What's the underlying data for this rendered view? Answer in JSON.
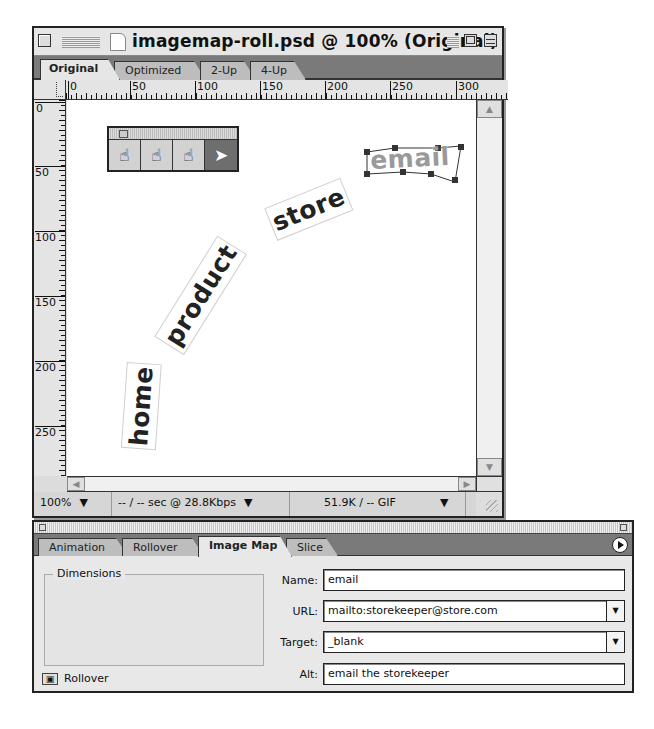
{
  "document_window": {
    "title": "imagemap-roll.psd @ 100% (Original)",
    "tabs": [
      {
        "label": "Original",
        "active": true
      },
      {
        "label": "Optimized",
        "active": false
      },
      {
        "label": "2-Up",
        "active": false
      },
      {
        "label": "4-Up",
        "active": false
      }
    ],
    "ruler_h": [
      "0",
      "50",
      "100",
      "150",
      "200",
      "250",
      "300"
    ],
    "ruler_v": [
      "0",
      "50",
      "100",
      "150",
      "200",
      "250"
    ],
    "tool_palette": {
      "tools": [
        {
          "name": "rectangle-image-map-tool",
          "glyph": "☝"
        },
        {
          "name": "circle-image-map-tool",
          "glyph": "☝"
        },
        {
          "name": "polygon-image-map-tool",
          "glyph": "☝"
        },
        {
          "name": "image-map-select-tool",
          "glyph": "➤"
        }
      ]
    },
    "canvas_words": [
      "home",
      "product",
      "store",
      "email"
    ],
    "status": {
      "zoom": "100%",
      "download": "-- / -- sec @ 28.8Kbps",
      "size_format": "51.9K / -- GIF"
    }
  },
  "panel": {
    "tabs": [
      {
        "label": "Animation",
        "active": false
      },
      {
        "label": "Rollover",
        "active": false
      },
      {
        "label": "Image Map",
        "active": true
      },
      {
        "label": "Slice",
        "active": false
      }
    ],
    "dimensions_label": "Dimensions",
    "rollover_label": "Rollover",
    "fields": {
      "name": {
        "label": "Name:",
        "value": "email"
      },
      "url": {
        "label": "URL:",
        "value": "mailto:storekeeper@store.com"
      },
      "target": {
        "label": "Target:",
        "value": "_blank"
      },
      "alt": {
        "label": "Alt:",
        "value": "email the storekeeper"
      }
    }
  }
}
